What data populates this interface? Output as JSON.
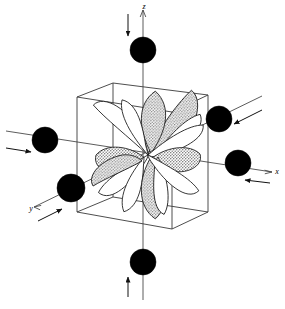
{
  "figure": {
    "background_color": "#ffffff",
    "line_color": "#3a3a3a",
    "ligand_color": "#000000",
    "lobe_shaded_color": "#b9b9b9",
    "lobe_white_color": "#ffffff"
  },
  "axes": [
    {
      "name": "z",
      "label": "z",
      "label_x": 144,
      "label_y": 9,
      "direction": "up"
    },
    {
      "name": "x",
      "label": "x",
      "label_x": 277,
      "label_y": 174,
      "direction": "right"
    },
    {
      "name": "y",
      "label": "y",
      "label_x": 31,
      "label_y": 211,
      "direction": "lower-left"
    }
  ],
  "ligands": [
    {
      "name": "ligand-z-top",
      "cx": 143,
      "cy": 50,
      "r": 13,
      "axis": "z"
    },
    {
      "name": "ligand-z-bottom",
      "cx": 143,
      "cy": 262,
      "r": 13,
      "axis": "z"
    },
    {
      "name": "ligand-x-left",
      "cx": 45,
      "cy": 140,
      "r": 13,
      "axis": "x"
    },
    {
      "name": "ligand-x-right",
      "cx": 238,
      "cy": 163,
      "r": 13,
      "axis": "x"
    },
    {
      "name": "ligand-y-back",
      "cx": 219,
      "cy": 119,
      "r": 13,
      "axis": "y"
    },
    {
      "name": "ligand-y-front",
      "cx": 71,
      "cy": 188,
      "r": 14,
      "axis": "y"
    }
  ],
  "cube": {
    "front_top_left": [
      77,
      97
    ],
    "front_top_right": [
      172,
      112
    ],
    "front_bottom_right": [
      172,
      229
    ],
    "front_bottom_left": [
      77,
      212
    ],
    "back_top_left": [
      113,
      83
    ],
    "back_top_right": [
      208,
      95
    ],
    "back_bottom_right": [
      208,
      212
    ],
    "back_bottom_left": [
      113,
      197
    ]
  },
  "orbital": {
    "center": [
      148,
      155
    ],
    "lobe_count": 12,
    "description": "multi-lobed d orbital cluster"
  },
  "arrows": {
    "count": 6,
    "description": "ligand approach arrows pointing toward the central metal"
  }
}
